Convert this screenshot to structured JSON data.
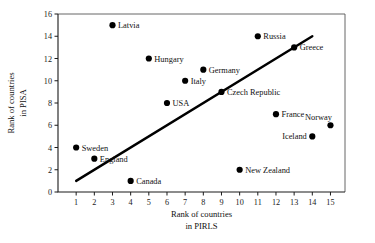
{
  "chart_data": {
    "type": "scatter",
    "title": "",
    "xlabel": "Rank of countries in PIRLS",
    "ylabel": "Rank of countries in PISA",
    "xlabel_line1": "Rank of countries",
    "xlabel_line2": "in PIRLS",
    "ylabel_line1": "Rank of countries",
    "ylabel_line2": "in PISA",
    "xlim": [
      0,
      15.8
    ],
    "ylim": [
      0,
      16
    ],
    "grid": false,
    "legend": "none",
    "xticks": [
      1,
      2,
      3,
      4,
      5,
      6,
      7,
      8,
      9,
      10,
      11,
      12,
      13,
      14,
      15
    ],
    "yticks": [
      0,
      2,
      4,
      6,
      8,
      10,
      12,
      14,
      16
    ],
    "xtick_labels": [
      "1",
      "2",
      "3",
      "4",
      "5",
      "6",
      "7",
      "8",
      "9",
      "10",
      "11",
      "12",
      "13",
      "14",
      "15"
    ],
    "ytick_labels": [
      "0",
      "2",
      "4",
      "6",
      "8",
      "10",
      "12",
      "14",
      "16"
    ],
    "marker_color": "#000000",
    "line_color": "#000000",
    "points": [
      {
        "label": "Sweden",
        "x": 1,
        "y": 4,
        "anchor": "right"
      },
      {
        "label": "England",
        "x": 2,
        "y": 3,
        "anchor": "right"
      },
      {
        "label": "Latvia",
        "x": 3,
        "y": 15,
        "anchor": "right"
      },
      {
        "label": "Canada",
        "x": 4,
        "y": 1,
        "anchor": "right"
      },
      {
        "label": "Hungary",
        "x": 5,
        "y": 12,
        "anchor": "right"
      },
      {
        "label": "USA",
        "x": 6,
        "y": 8,
        "anchor": "right"
      },
      {
        "label": "Italy",
        "x": 7,
        "y": 10,
        "anchor": "right"
      },
      {
        "label": "Germany",
        "x": 8,
        "y": 11,
        "anchor": "right"
      },
      {
        "label": "Czech Republic",
        "x": 9,
        "y": 9,
        "anchor": "right"
      },
      {
        "label": "New Zealand",
        "x": 10,
        "y": 2,
        "anchor": "right"
      },
      {
        "label": "Russia",
        "x": 11,
        "y": 14,
        "anchor": "right"
      },
      {
        "label": "France",
        "x": 12,
        "y": 7,
        "anchor": "right"
      },
      {
        "label": "Greece",
        "x": 13,
        "y": 13,
        "anchor": "right"
      },
      {
        "label": "Iceland",
        "x": 14,
        "y": 5,
        "anchor": "left"
      },
      {
        "label": "Norway",
        "x": 15,
        "y": 6,
        "anchor": "above-left"
      }
    ],
    "trend_line": {
      "x1": 1,
      "y1": 1,
      "x2": 14,
      "y2": 14
    }
  }
}
